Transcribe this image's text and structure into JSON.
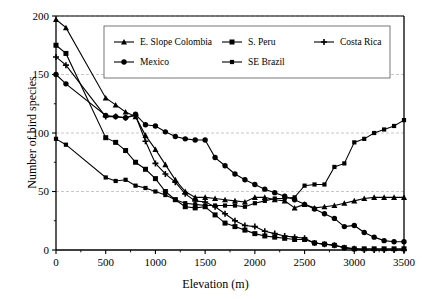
{
  "chart_data": {
    "type": "line",
    "title": "",
    "xlabel": "Elevation (m)",
    "ylabel": "Number of bird species",
    "xlim": [
      0,
      3500
    ],
    "ylim": [
      0,
      200
    ],
    "xticks": [
      0,
      500,
      1000,
      1500,
      2000,
      2500,
      3000,
      3500
    ],
    "yticks": [
      0,
      50,
      100,
      150,
      200
    ],
    "grid": "horizontal-dashed-at-50-100-150-200",
    "legend_position": "top-center-inside",
    "series": [
      {
        "name": "E. Slope Colombia",
        "marker": "triangle",
        "color": "#000000",
        "x": [
          0,
          100,
          500,
          600,
          700,
          800,
          900,
          1000,
          1100,
          1200,
          1300,
          1400,
          1500,
          1600,
          1700,
          1800,
          1900,
          2000,
          2100,
          2200,
          2300,
          2400,
          2500,
          2600,
          2700,
          2800,
          2900,
          3000,
          3100,
          3200,
          3300,
          3400,
          3500
        ],
        "y": [
          197,
          190,
          130,
          124,
          118,
          114,
          98,
          86,
          73,
          60,
          50,
          45,
          45,
          44,
          43,
          42,
          41,
          45,
          45,
          43,
          42,
          36,
          39,
          36,
          37,
          38,
          40,
          42,
          44,
          45,
          45,
          45,
          45
        ]
      },
      {
        "name": "S. Peru",
        "marker": "square",
        "color": "#000000",
        "x": [
          0,
          100,
          500,
          600,
          700,
          800,
          900,
          1000,
          1100,
          1200,
          1300,
          1400,
          1500,
          1600,
          1700,
          1800,
          1900,
          2000,
          2100,
          2200,
          2300,
          2400,
          2500,
          2600,
          2700,
          2800,
          2900,
          3000,
          3100,
          3200,
          3300,
          3400,
          3500
        ],
        "y": [
          175,
          168,
          96,
          92,
          85,
          75,
          69,
          61,
          50,
          43,
          37,
          36,
          37,
          30,
          23,
          20,
          17,
          14,
          12,
          11,
          10,
          9,
          9,
          6,
          5,
          4,
          2,
          1,
          1,
          1,
          1,
          1,
          1
        ]
      },
      {
        "name": "Costa Rica",
        "marker": "cross",
        "color": "#000000",
        "x": [
          0,
          100,
          500,
          600,
          700,
          800,
          900,
          1000,
          1100,
          1200,
          1300,
          1400,
          1500,
          1600,
          1700,
          1800,
          1900,
          2000,
          2100,
          2200,
          2300,
          2400,
          2500,
          2600,
          2700,
          2800,
          2900,
          3000,
          3100,
          3200,
          3300,
          3400,
          3500
        ],
        "y": [
          165,
          158,
          114,
          114,
          113,
          115,
          93,
          74,
          65,
          58,
          48,
          42,
          41,
          37,
          31,
          25,
          21,
          20,
          16,
          14,
          12,
          11,
          10,
          6,
          5,
          4,
          2,
          1,
          0,
          0,
          0,
          0,
          0
        ]
      },
      {
        "name": "Mexico",
        "marker": "circle",
        "color": "#000000",
        "x": [
          0,
          100,
          500,
          600,
          700,
          800,
          900,
          1000,
          1100,
          1200,
          1300,
          1400,
          1500,
          1600,
          1700,
          1800,
          1900,
          2000,
          2100,
          2200,
          2300,
          2400,
          2500,
          2600,
          2700,
          2800,
          2900,
          3000,
          3100,
          3200,
          3300,
          3400,
          3500
        ],
        "y": [
          150,
          142,
          115,
          114,
          113,
          116,
          107,
          106,
          101,
          97,
          95,
          94,
          94,
          79,
          72,
          65,
          60,
          56,
          52,
          49,
          46,
          43,
          39,
          35,
          31,
          27,
          20,
          21,
          15,
          11,
          8,
          7,
          7
        ]
      },
      {
        "name": "SE Brazil",
        "marker": "square-small",
        "color": "#000000",
        "x": [
          0,
          100,
          500,
          600,
          700,
          800,
          900,
          1000,
          1100,
          1200,
          1300,
          1400,
          1500,
          1600,
          1700,
          1800,
          1900,
          2000,
          2100,
          2200,
          2300,
          2400,
          2500,
          2600,
          2700,
          2800,
          2900,
          3000,
          3100,
          3200,
          3300,
          3400,
          3500
        ],
        "y": [
          95,
          90,
          62,
          59,
          60,
          55,
          53,
          50,
          47,
          43,
          40,
          39,
          38,
          38,
          38,
          38,
          37,
          40,
          42,
          44,
          44,
          45,
          55,
          56,
          56,
          71,
          74,
          92,
          95,
          100,
          103,
          106,
          111
        ]
      }
    ]
  },
  "legend": {
    "entries": [
      {
        "label": "E. Slope Colombia",
        "marker": "triangle"
      },
      {
        "label": "S. Peru",
        "marker": "square"
      },
      {
        "label": "Costa Rica",
        "marker": "cross"
      },
      {
        "label": "Mexico",
        "marker": "circle"
      },
      {
        "label": "SE Brazil",
        "marker": "square-small"
      }
    ]
  }
}
